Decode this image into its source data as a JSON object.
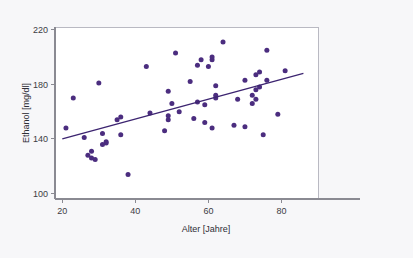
{
  "chart_data": {
    "type": "scatter",
    "title": "",
    "subtitle": "",
    "xlabel": "Alter [Jahre]",
    "ylabel": "Ethanol [mg/dl]",
    "xlim": [
      18,
      90
    ],
    "ylim": [
      96,
      222
    ],
    "xticks": [
      20,
      40,
      60,
      80
    ],
    "yticks": [
      100,
      140,
      180,
      220
    ],
    "xtick_labels": [
      "20",
      "40",
      "60",
      "80"
    ],
    "ytick_labels": [
      "100",
      "140",
      "180",
      "220"
    ],
    "grid": false,
    "legend": null,
    "legend_position": "none",
    "annotations": [],
    "point_color": "#4b2d7f",
    "line_color": "#3c2470",
    "background_color": "#f7f7f9",
    "plot_background_color": "#ffffff",
    "axis_color": "#8a8a92",
    "series": [
      {
        "name": "Ethanol vs Alter",
        "marker": "circle",
        "marker_size": 5,
        "points": [
          [
            21,
            148
          ],
          [
            23,
            170
          ],
          [
            26,
            141
          ],
          [
            27,
            128
          ],
          [
            28,
            126
          ],
          [
            28,
            131
          ],
          [
            29,
            125
          ],
          [
            30,
            181
          ],
          [
            31,
            136
          ],
          [
            31,
            144
          ],
          [
            32,
            138
          ],
          [
            32,
            137
          ],
          [
            35,
            154
          ],
          [
            36,
            156
          ],
          [
            36,
            143
          ],
          [
            38,
            114
          ],
          [
            43,
            193
          ],
          [
            44,
            159
          ],
          [
            48,
            146
          ],
          [
            49,
            175
          ],
          [
            49,
            157
          ],
          [
            49,
            154
          ],
          [
            50,
            166
          ],
          [
            51,
            203
          ],
          [
            52,
            160
          ],
          [
            55,
            182
          ],
          [
            56,
            155
          ],
          [
            57,
            194
          ],
          [
            57,
            167
          ],
          [
            58,
            198
          ],
          [
            59,
            152
          ],
          [
            59,
            165
          ],
          [
            60,
            193
          ],
          [
            61,
            198
          ],
          [
            61,
            200
          ],
          [
            61,
            148
          ],
          [
            62,
            170
          ],
          [
            62,
            172
          ],
          [
            62,
            179
          ],
          [
            64,
            211
          ],
          [
            67,
            150
          ],
          [
            68,
            169
          ],
          [
            70,
            183
          ],
          [
            70,
            149
          ],
          [
            72,
            166
          ],
          [
            72,
            172
          ],
          [
            73,
            169
          ],
          [
            73,
            176
          ],
          [
            73,
            187
          ],
          [
            74,
            189
          ],
          [
            74,
            178
          ],
          [
            75,
            143
          ],
          [
            76,
            205
          ],
          [
            76,
            183
          ],
          [
            79,
            158
          ],
          [
            81,
            190
          ]
        ]
      }
    ],
    "trend_line": {
      "name": "Regressionsgerade",
      "x_start": 20,
      "y_start": 140,
      "x_end": 86,
      "y_end": 188
    }
  }
}
